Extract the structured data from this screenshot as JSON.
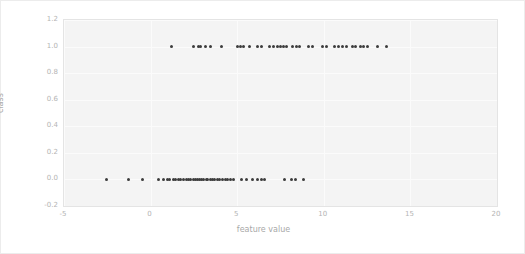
{
  "chart_data": {
    "type": "scatter",
    "title": "",
    "xlabel": "feature value",
    "ylabel": "class",
    "xlim": [
      -5,
      20
    ],
    "ylim": [
      -0.2,
      1.2
    ],
    "xticks": [
      -5,
      0,
      5,
      10,
      15,
      20
    ],
    "xtick_labels": [
      "-5",
      "0",
      "5",
      "10",
      "15",
      "20"
    ],
    "yticks": [
      -0.2,
      0.0,
      0.2,
      0.4,
      0.6,
      0.8,
      1.0,
      1.2
    ],
    "ytick_labels": [
      "-0.2",
      "0.0",
      "0.2",
      "0.4",
      "0.6",
      "0.8",
      "1.0",
      "1.2"
    ],
    "grid": true,
    "legend": null,
    "marker_color": "#3c3c3c",
    "marker_size": 3,
    "series": [
      {
        "name": "class 0",
        "y": 0.0,
        "x": [
          -2.55,
          -1.3,
          -0.45,
          0.45,
          0.75,
          0.95,
          1.1,
          1.3,
          1.45,
          1.6,
          1.75,
          1.9,
          2.05,
          2.2,
          2.3,
          2.45,
          2.6,
          2.7,
          2.85,
          2.95,
          3.05,
          3.2,
          3.3,
          3.45,
          3.6,
          3.7,
          3.85,
          4.0,
          4.15,
          4.3,
          4.45,
          4.6,
          4.8,
          5.25,
          5.55,
          5.9,
          6.15,
          6.4,
          6.6,
          7.75,
          8.15,
          8.35,
          8.85
        ]
      },
      {
        "name": "class 1",
        "y": 1.0,
        "x": [
          1.2,
          2.5,
          2.75,
          2.9,
          3.15,
          3.45,
          4.1,
          5.0,
          5.2,
          5.35,
          5.7,
          6.15,
          6.4,
          6.85,
          7.1,
          7.3,
          7.5,
          7.65,
          7.85,
          8.2,
          8.4,
          8.6,
          9.1,
          9.35,
          9.9,
          10.15,
          10.6,
          10.85,
          11.1,
          11.3,
          11.65,
          11.85,
          12.1,
          12.3,
          12.55,
          13.1,
          13.6
        ]
      }
    ]
  },
  "axis": {
    "xlabel": "feature value",
    "ylabel": "class"
  },
  "colors": {
    "figure_background": "#ffffff",
    "axes_background": "#f4f4f4",
    "grid": "#fbfbfb",
    "tick_text": "#b4b4b4",
    "label_text": "#a8a8a8",
    "marker": "#3c3c3c"
  }
}
